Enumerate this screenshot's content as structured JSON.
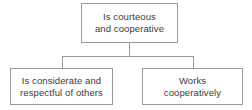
{
  "diagram": {
    "type": "hierarchy-tree",
    "orientation": "top-down",
    "background_color": "#ffffff",
    "border_color": "#9a9a9a",
    "text_color": "#3a3a3a",
    "root": {
      "id": "root",
      "label": "Is courteous\nand cooperative",
      "line_1": "Is courteous",
      "line_2": "and cooperative"
    },
    "children": [
      {
        "id": "child-1",
        "label": "Is considerate and\nrespectful of others",
        "line_1": "Is considerate and",
        "line_2": "respectful of others"
      },
      {
        "id": "child-2",
        "label": "Works\ncooperatively",
        "line_1": "Works",
        "line_2": "cooperatively"
      }
    ]
  }
}
